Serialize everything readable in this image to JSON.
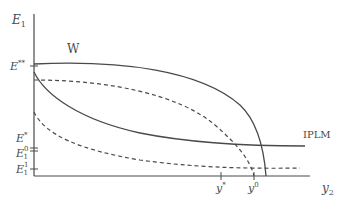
{
  "diagram": {
    "y_axis_label": "E",
    "y_axis_label_sub": "1",
    "x_axis_label": "y",
    "x_axis_label_sub": "2",
    "curve_labels": {
      "W": "W",
      "IPLM": "IPLM"
    },
    "y_ticks": [
      {
        "main": "E",
        "sup": "**",
        "sub": ""
      },
      {
        "main": "E",
        "sup": "*",
        "sub": ""
      },
      {
        "main": "E",
        "sup": "0",
        "sub": "1"
      },
      {
        "main": "E",
        "sup": "1",
        "sub": "1"
      }
    ],
    "x_ticks": [
      {
        "main": "y",
        "sup": "*"
      },
      {
        "main": "y",
        "sup": "0"
      }
    ],
    "colors": {
      "line": "#4a4a4a",
      "background": "#ffffff"
    }
  }
}
